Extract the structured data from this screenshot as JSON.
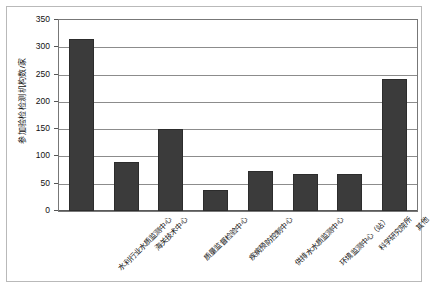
{
  "chart_data": {
    "type": "bar",
    "title": "",
    "subtitle": "",
    "xlabel": "",
    "ylabel": "参加验检检测机构数/家",
    "ylim": [
      0,
      350
    ],
    "yticks": [
      0,
      50,
      100,
      150,
      200,
      250,
      300,
      350
    ],
    "ytick_labels": [
      "0",
      "50",
      "100",
      "150",
      "200",
      "250",
      "300",
      "350"
    ],
    "grid": true,
    "legend": false,
    "legend_position": "none",
    "bar_color": "#3b3b3b",
    "categories": [
      "水利行业水质监测中心",
      "海关技术中心",
      "质量监督检验中心",
      "疾病预防控制中心",
      "供排水水质监测中心",
      "环境监测中心（站）",
      "科学研究院所",
      "其他"
    ],
    "values": [
      315,
      90,
      150,
      39,
      73,
      68,
      68,
      242
    ],
    "series": [
      {
        "name": "参加验检检测机构数",
        "values": [
          315,
          90,
          150,
          39,
          73,
          68,
          68,
          242
        ]
      }
    ]
  },
  "figure": {
    "caption": "",
    "axis_line_color": "#777777",
    "grid_color": "#8c8c8c",
    "frame_color": "#b9b9b9"
  }
}
